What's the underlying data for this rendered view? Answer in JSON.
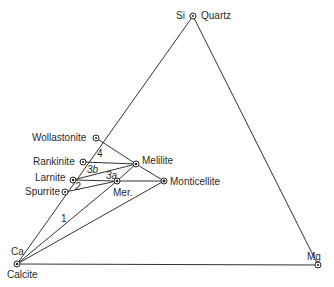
{
  "diagram": {
    "type": "ternary-phase-diagram",
    "vertices": {
      "top": {
        "element": "Si",
        "mineral": "Quartz"
      },
      "left": {
        "element": "Ca",
        "mineral": "Calcite"
      },
      "right": {
        "element": "Mg",
        "mineral": ""
      }
    },
    "phases": [
      {
        "id": "quartz",
        "label": "Quartz"
      },
      {
        "id": "wollastonite",
        "label": "Wollastonite"
      },
      {
        "id": "rankinite",
        "label": "Rankinite"
      },
      {
        "id": "larnite",
        "label": "Larnite"
      },
      {
        "id": "spurrite",
        "label": "Spurrite"
      },
      {
        "id": "calcite",
        "label": "Calcite"
      },
      {
        "id": "melilite",
        "label": "Melilite"
      },
      {
        "id": "merwinite",
        "label": "Mer."
      },
      {
        "id": "monticellite",
        "label": "Monticellite"
      }
    ],
    "fields": [
      {
        "id": "1",
        "label": "1"
      },
      {
        "id": "2",
        "label": "2"
      },
      {
        "id": "3a",
        "label": "3a"
      },
      {
        "id": "3b",
        "label": "3b"
      },
      {
        "id": "4",
        "label": "4"
      }
    ],
    "tie_lines": [
      [
        "Si",
        "Ca"
      ],
      [
        "Si",
        "Mg"
      ],
      [
        "Ca",
        "Mg"
      ],
      [
        "Wollastonite",
        "Melilite"
      ],
      [
        "Rankinite",
        "Melilite"
      ],
      [
        "Larnite",
        "Melilite"
      ],
      [
        "Larnite",
        "Merwinite"
      ],
      [
        "Spurrite",
        "Merwinite"
      ],
      [
        "Merwinite",
        "Melilite"
      ],
      [
        "Merwinite",
        "Monticellite"
      ],
      [
        "Melilite",
        "Monticellite"
      ],
      [
        "Calcite",
        "Merwinite"
      ],
      [
        "Calcite",
        "Monticellite"
      ]
    ]
  }
}
